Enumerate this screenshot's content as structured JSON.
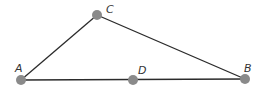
{
  "diagram": {
    "type": "geometry-triangle",
    "colors": {
      "line": "#2b2b2b",
      "point": "#8a8a8a",
      "label": "#333333"
    },
    "points": [
      {
        "name": "A",
        "x": 21,
        "y": 80,
        "label_x": 15,
        "label_y": 72
      },
      {
        "name": "B",
        "x": 245,
        "y": 79,
        "label_x": 244,
        "label_y": 72
      },
      {
        "name": "C",
        "x": 97,
        "y": 15,
        "label_x": 106,
        "label_y": 13
      },
      {
        "name": "D",
        "x": 133,
        "y": 80,
        "label_x": 138,
        "label_y": 74
      }
    ],
    "segments": [
      {
        "from": "A",
        "to": "C"
      },
      {
        "from": "C",
        "to": "B"
      },
      {
        "from": "A",
        "to": "B"
      }
    ]
  }
}
